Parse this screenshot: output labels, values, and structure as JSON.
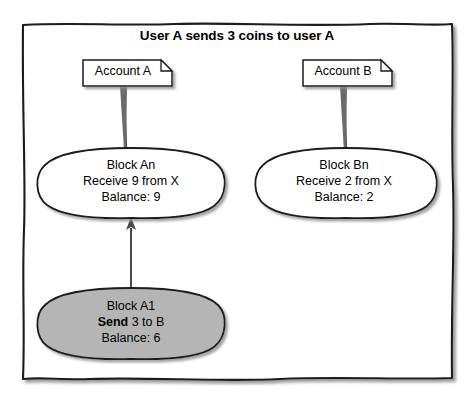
{
  "diagram": {
    "title": "User A sends 3 coins to user A",
    "colors": {
      "stroke": "#1a1a1a",
      "note_fill": "#ffffff",
      "node_fill": "#ffffff",
      "highlight_fill": "#b5b5b5",
      "shadow": "#9a9a9a",
      "background": "#ffffff"
    },
    "notes": [
      {
        "id": "account-a",
        "label": "Account A"
      },
      {
        "id": "account-b",
        "label": "Account B"
      }
    ],
    "nodes": [
      {
        "id": "block-an",
        "line1": "Block An",
        "line2": "Receive 9 from X",
        "line3": "Balance: 9",
        "highlighted": false
      },
      {
        "id": "block-bn",
        "line1": "Block Bn",
        "line2": "Receive 2 from X",
        "line3": "Balance: 2",
        "highlighted": false
      },
      {
        "id": "block-a1",
        "line1": "Block A1",
        "line2_bold": "Send",
        "line2_rest": " 3 to B",
        "line3": "Balance: 6",
        "highlighted": true
      }
    ],
    "connectors": [
      {
        "id": "note-a-to-block-an",
        "from": "account-a",
        "to": "block-an",
        "arrow": false
      },
      {
        "id": "note-b-to-block-bn",
        "from": "account-b",
        "to": "block-bn",
        "arrow": false
      },
      {
        "id": "block-a1-to-block-an",
        "from": "block-a1",
        "to": "block-an",
        "arrow": true
      }
    ]
  }
}
